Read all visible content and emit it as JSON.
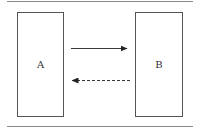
{
  "diagram": {
    "type": "block-flow",
    "colors": {
      "background": "#ffffff",
      "rule": "#8a8a8a",
      "box_stroke": "#555555",
      "arrow": "#222222",
      "text": "#333333"
    },
    "nodes": [
      {
        "id": "A",
        "label": "A"
      },
      {
        "id": "B",
        "label": "B"
      }
    ],
    "edges": [
      {
        "from": "A",
        "to": "B",
        "style": "solid"
      },
      {
        "from": "B",
        "to": "A",
        "style": "dashed"
      }
    ]
  }
}
